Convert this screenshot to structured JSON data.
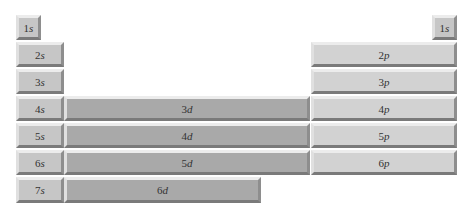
{
  "diagram": {
    "title": "",
    "blocks": {
      "s": [
        {
          "n": "1",
          "l": "s",
          "label": "1s",
          "side": "left"
        },
        {
          "n": "2",
          "l": "s",
          "label": "2s"
        },
        {
          "n": "3",
          "l": "s",
          "label": "3s"
        },
        {
          "n": "4",
          "l": "s",
          "label": "4s"
        },
        {
          "n": "5",
          "l": "s",
          "label": "5s"
        },
        {
          "n": "6",
          "l": "s",
          "label": "6s"
        },
        {
          "n": "7",
          "l": "s",
          "label": "7s"
        }
      ],
      "s_right": {
        "n": "1",
        "l": "s",
        "label": "1s"
      },
      "d": [
        {
          "n": "3",
          "l": "d",
          "label": "3d"
        },
        {
          "n": "4",
          "l": "d",
          "label": "4d"
        },
        {
          "n": "5",
          "l": "d",
          "label": "5d"
        },
        {
          "n": "6",
          "l": "d",
          "label": "6d"
        }
      ],
      "p": [
        {
          "n": "2",
          "l": "p",
          "label": "2p"
        },
        {
          "n": "3",
          "l": "p",
          "label": "3p"
        },
        {
          "n": "4",
          "l": "p",
          "label": "4p"
        },
        {
          "n": "5",
          "l": "p",
          "label": "5p"
        },
        {
          "n": "6",
          "l": "p",
          "label": "6p"
        }
      ]
    },
    "colors": {
      "s": "#c6c6c6",
      "d": "#a9a9a9",
      "p": "#d2d2d2"
    }
  }
}
